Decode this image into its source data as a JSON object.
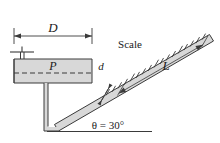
{
  "figure": {
    "labels": {
      "diameter_D": "D",
      "pressure_P": "P",
      "tube_diameter_d": "d",
      "scale": "Scale",
      "length_L": "L",
      "angle": "θ = 30°"
    },
    "colors": {
      "line": "#3a3a3a",
      "fluid_fill": "#d8d8d8",
      "wall_fill": "#c9c9c9",
      "tube_fill": "#d0d0d0",
      "text": "#1a1a1a",
      "background": "#ffffff"
    },
    "geometry": {
      "incline_angle_deg": 30,
      "scale_tick_count": 17
    }
  }
}
